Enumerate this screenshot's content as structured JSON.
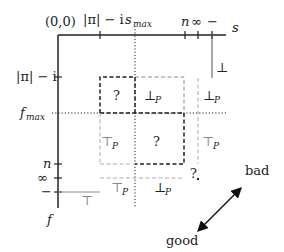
{
  "axes": {
    "origin": "(0,0)",
    "x_label": "s",
    "y_label": "f",
    "x_ticks": [
      {
        "label_main": "|π| − i",
        "kind": "tick"
      },
      {
        "label_main": "s",
        "label_sub": "max",
        "kind": "dotted"
      },
      {
        "label_main": "n",
        "kind": "tick"
      },
      {
        "label_main": "∞",
        "kind": "tick"
      },
      {
        "label_main": "−",
        "kind": "tick"
      }
    ],
    "y_ticks": [
      {
        "label_main": "|π| − i",
        "kind": "tick"
      },
      {
        "label_main": "f",
        "label_sub": "max",
        "kind": "dotted"
      },
      {
        "label_main": "n",
        "kind": "tick"
      },
      {
        "label_main": "∞",
        "kind": "tick"
      },
      {
        "label_main": "−",
        "kind": "tick"
      }
    ]
  },
  "regions": {
    "bottom_right_of_axis": "⊥",
    "bottom_left_of_axis": "⊤",
    "q_top_left": "?",
    "bot_p_top_mid": "⊥",
    "bot_p_top_right": "⊥",
    "top_p_mid_left": "⊤",
    "q_center": "?",
    "top_p_mid_right": "⊤",
    "top_p_bottom": "⊤",
    "bot_p_bottom": "⊥",
    "q_corner": "?",
    "subscript_p": "P"
  },
  "legend": {
    "bad": "bad",
    "good": "good"
  }
}
